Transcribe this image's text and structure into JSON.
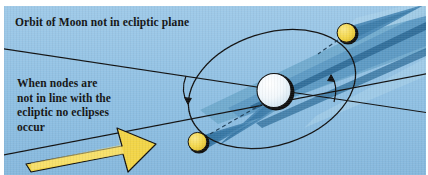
{
  "figure": {
    "kind": "astronomy-diagram",
    "background_color": "#8fc0e3",
    "plate_border_color": "#ffffff"
  },
  "captions": {
    "title": "Orbit of Moon not in ecliptic plane",
    "note": "When nodes are\nnot in line with the\necliptic no eclipses\noccur"
  },
  "bodies": [
    {
      "name": "earth",
      "label": "Earth",
      "fill": "#eef5fb",
      "outline": "#101010",
      "cx": 272,
      "cy": 86,
      "r": 18
    },
    {
      "name": "moon-upper",
      "label": "Moon at upper node position",
      "fill": "#f2d547",
      "outline": "#101010",
      "cx": 343,
      "cy": 27,
      "r": 10
    },
    {
      "name": "moon-lower",
      "label": "Moon at lower node position",
      "fill": "#f2d547",
      "outline": "#101010",
      "cx": 194,
      "cy": 136,
      "r": 10
    }
  ],
  "shadows": [
    {
      "name": "earth-umbra-cone",
      "fill": "#3a7fae",
      "direction": "down-right"
    },
    {
      "name": "moon-upper-umbra-cone",
      "fill": "#3a7fae",
      "direction": "right"
    },
    {
      "name": "moon-lower-umbra-cone",
      "fill": "#3a7fae",
      "direction": "up-right"
    }
  ],
  "sunbeam": {
    "name": "sunlight-beam",
    "description": "Band of sunlight arriving from upper right",
    "band_color": "#5d9ac4",
    "stripe_color": "#2f6d99"
  },
  "orbit": {
    "name": "moon-orbit-ellipse",
    "stroke": "#101010",
    "description": "Tilted elliptical orbit of the Moon about the Earth",
    "direction_arrows": 2
  },
  "lines": [
    {
      "name": "ecliptic-plane-line",
      "stroke": "#101010",
      "style": "solid",
      "description": "Ecliptic plane shown edge-on"
    },
    {
      "name": "node-line",
      "stroke": "#101010",
      "style": "solid",
      "description": "Line of nodes of the lunar orbit"
    },
    {
      "name": "earth-moon-sightline",
      "stroke": "#22435c",
      "style": "dashed",
      "description": "Dashed sightline from Earth to lower Moon"
    },
    {
      "name": "moon-upper-sightline",
      "stroke": "#22435c",
      "style": "dashed",
      "description": "Dashed sightline at upper Moon"
    }
  ],
  "sun_arrow": {
    "name": "sunlight-direction-arrow",
    "fill": "#f2d547",
    "outline": "#101010",
    "points": "toward upper right",
    "description": "Large yellow arrow indicating direction of sunlight"
  },
  "colors": {
    "sky": "#8fc0e3",
    "moon_yellow": "#f2d547",
    "earth_white": "#eef5fb",
    "shadow_blue": "#3a7fae",
    "beam_blue": "#5d9ac4",
    "ink": "#101010"
  }
}
